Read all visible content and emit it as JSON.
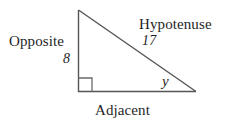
{
  "figure": {
    "type": "right-triangle-labeled-diagram",
    "background_color": "#ffffff",
    "stroke_color": "#555555",
    "text_color": "#1f1f1f"
  },
  "labels": {
    "opposite": "Opposite",
    "opposite_value": "8",
    "hypotenuse": "Hypotenuse",
    "hypotenuse_value": "17",
    "adjacent": "Adjacent",
    "angle": "y"
  },
  "geometry": {
    "apex": {
      "x": 78,
      "y": 10
    },
    "right_angle_vertex": {
      "x": 78,
      "y": 92
    },
    "angle_vertex": {
      "x": 196,
      "y": 92
    },
    "right_angle_marker_size": 14
  }
}
